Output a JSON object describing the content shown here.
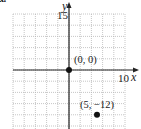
{
  "figure": {
    "part_label": "a.",
    "x_axis_label": "x",
    "y_axis_label": "y",
    "x_tick_label": "10",
    "y_tick_label": "15",
    "points": [
      {
        "label": "(0, 0)"
      },
      {
        "label": "(5, −12)"
      }
    ]
  },
  "chart_data": {
    "type": "scatter",
    "title": "",
    "xlabel": "x",
    "ylabel": "y",
    "xlim": [
      -10,
      10
    ],
    "ylim": [
      -15,
      15
    ],
    "x_grid_step": 2,
    "y_grid_step": 3,
    "grid": true,
    "tick_labels": {
      "x": [
        "10"
      ],
      "y": [
        "15"
      ]
    },
    "series": [
      {
        "name": "points",
        "x": [
          0,
          5
        ],
        "y": [
          0,
          -12
        ],
        "labels": [
          "(0, 0)",
          "(5, −12)"
        ]
      }
    ],
    "colors": {
      "grid": "#b8b8b8",
      "axis": "#222222",
      "point": "#111111"
    }
  }
}
